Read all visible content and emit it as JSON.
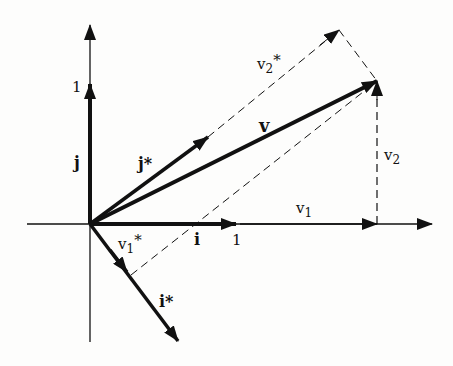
{
  "diagram": {
    "labels": {
      "y_unit": "1",
      "x_unit": "1",
      "j": "j",
      "j_star": "j*",
      "v": "v",
      "v2_star": "v2*",
      "v2": "v2",
      "v1": "v1",
      "v1_star": "v1*",
      "i": "i",
      "i_star": "i*"
    },
    "colors": {
      "ink": "#111111",
      "background": "#fdfdfc"
    }
  }
}
